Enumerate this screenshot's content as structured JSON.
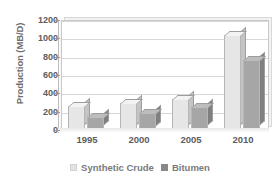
{
  "chart_data": {
    "type": "bar",
    "title": "",
    "xlabel": "",
    "ylabel": "Production (MB/D)",
    "categories": [
      "1995",
      "2000",
      "2005",
      "2010"
    ],
    "series": [
      {
        "name": "Synthetic Crude",
        "values": [
          250,
          280,
          330,
          1030
        ],
        "color": "#e6e6e6"
      },
      {
        "name": "Bitumen",
        "values": [
          130,
          180,
          240,
          750
        ],
        "color": "#a6a6a6"
      }
    ],
    "ylim": [
      0,
      1200
    ],
    "yticks": [
      0,
      200,
      400,
      600,
      800,
      1000,
      1200
    ],
    "ytick_labels": [
      "0",
      "200",
      "400",
      "600",
      "800",
      "1000",
      "1200"
    ],
    "grid": true,
    "legend_position": "bottom",
    "style": "3d-column"
  },
  "legend": {
    "items": [
      {
        "label": "Synthetic  Crude",
        "swatch": "light-gray-square"
      },
      {
        "label": "Bitumen",
        "swatch": "dark-gray-square"
      }
    ]
  }
}
